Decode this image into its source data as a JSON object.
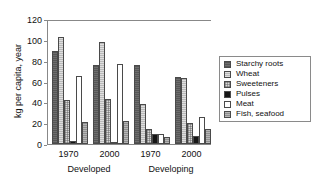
{
  "chart_data": {
    "type": "bar",
    "title": "",
    "xlabel": "",
    "ylabel": "kg per capita, year",
    "ylim": [
      0,
      120
    ],
    "yticks": [
      0,
      20,
      40,
      60,
      80,
      100,
      120
    ],
    "grid": false,
    "legend_position": "right",
    "categories": [
      "1970",
      "2000",
      "1970",
      "2000"
    ],
    "group_labels": [
      "Developed",
      "Developing"
    ],
    "series": [
      {
        "name": "Starchy roots",
        "color": "#6e6e6e",
        "values": [
          89,
          76,
          76,
          64
        ]
      },
      {
        "name": "Wheat",
        "color": "#b9b9b9",
        "values": [
          103,
          98,
          38,
          63
        ]
      },
      {
        "name": "Sweeteners",
        "color": "#d8d8d8",
        "values": [
          42,
          43,
          14,
          20
        ]
      },
      {
        "name": "Pulses",
        "color": "#161616",
        "values": [
          3,
          2,
          10,
          8
        ]
      },
      {
        "name": "Meat",
        "color": "#ffffff",
        "values": [
          65,
          77,
          10,
          26
        ]
      },
      {
        "name": "Fish, seafood",
        "color": "#8f8f8f",
        "values": [
          21,
          22,
          7,
          14
        ]
      }
    ]
  },
  "axis": {
    "y_title": "kg per capita, year",
    "y_tick_labels": [
      "120",
      "100",
      "80",
      "60",
      "40",
      "20",
      "0"
    ],
    "x_tick_labels": [
      "1970",
      "2000",
      "1970",
      "2000"
    ],
    "x_group_labels": [
      "Developed",
      "Developing"
    ]
  },
  "legend": {
    "items": [
      {
        "label": "Starchy roots"
      },
      {
        "label": "Wheat"
      },
      {
        "label": "Sweeteners"
      },
      {
        "label": "Pulses"
      },
      {
        "label": "Meat"
      },
      {
        "label": "Fish, seafood"
      }
    ]
  }
}
